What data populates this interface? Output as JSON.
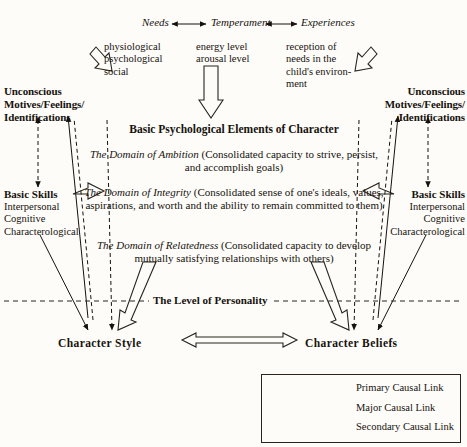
{
  "diagram": {
    "top_row": {
      "needs": "Needs",
      "temperament": "Temperament",
      "experiences": "Experiences"
    },
    "top_details": {
      "needs": [
        "physiological",
        "psychological",
        "social"
      ],
      "temperament": [
        "energy level",
        "arousal level"
      ],
      "experiences": [
        "reception of",
        "needs in the",
        "child's environ-",
        "ment"
      ]
    },
    "unconscious_left": [
      "Unconscious",
      "Motives/Feelings/",
      "Identifications"
    ],
    "unconscious_right": [
      "Unconscious",
      "Motives/Feelings/",
      "Identifications"
    ],
    "skills_left": {
      "heading": "Basic Skills",
      "items": [
        "Interpersonal",
        "Cognitive",
        "Characterological"
      ]
    },
    "skills_right": {
      "heading": "Basic Skills",
      "items": [
        "Interpersonal",
        "Cognitive",
        "Characterological"
      ]
    },
    "center": {
      "heading": "Basic Psychological Elements of Character",
      "domains": [
        {
          "name": "The Domain of Ambition",
          "description": "(Consolidated capacity to strive, persist, and accomplish goals)"
        },
        {
          "name": "The Domain of Integrity",
          "description": "(Consolidated sense of one's ideals, values, aspirations, and worth and the ability to remain committed to them)"
        },
        {
          "name": "The Domain of Relatedness",
          "description": "(Consolidated capacity to develop mutually satisfying relationships with others)"
        }
      ]
    },
    "level_line_label": "The Level of Personality",
    "bottom": {
      "character_style": "Character Style",
      "character_beliefs": "Character Beliefs"
    },
    "legend": {
      "items": [
        {
          "label": "Primary Causal Link",
          "style": "hollow-double-arrow"
        },
        {
          "label": "Major Causal Link",
          "style": "solid-double-arrow"
        },
        {
          "label": "Secondary Causal Link",
          "style": "dashed-double-arrow"
        }
      ]
    },
    "colors": {
      "ink": "#16120e",
      "paper": "#fdfcf8",
      "line": "#2a241d"
    }
  }
}
